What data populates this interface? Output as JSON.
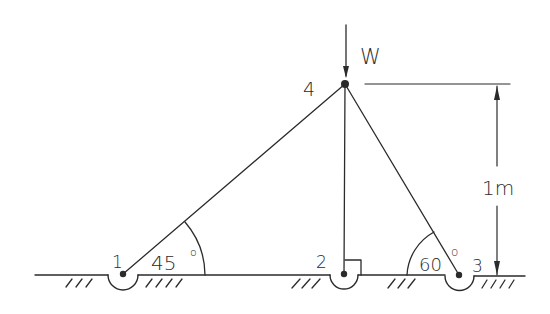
{
  "diagram": {
    "type": "truss-statics",
    "nodes": [
      {
        "id": "1",
        "label": "1",
        "x": 123,
        "y": 275
      },
      {
        "id": "2",
        "label": "2",
        "x": 344,
        "y": 275
      },
      {
        "id": "3",
        "label": "3",
        "x": 459,
        "y": 276
      },
      {
        "id": "4",
        "label": "4",
        "x": 345,
        "y": 84
      }
    ],
    "members": [
      {
        "from": "1",
        "to": "4"
      },
      {
        "from": "2",
        "to": "4"
      },
      {
        "from": "3",
        "to": "4"
      }
    ],
    "load": {
      "label": "W",
      "node": "4",
      "direction": "down"
    },
    "angles": [
      {
        "label": "45°",
        "at_node": "1"
      },
      {
        "label": "60°",
        "at_node": "3"
      }
    ],
    "right_angle_marker": {
      "at_node": "2"
    },
    "dimension": {
      "label": "1m",
      "from_y": "node-4",
      "to_y": "ground"
    },
    "ink_color": "#2b2b2b",
    "background": "#ffffff"
  },
  "labels": {
    "node1": "1",
    "node2": "2",
    "node3": "3",
    "node4": "4",
    "load": "W",
    "angle1": "45",
    "angle3": "60",
    "degree": "o",
    "dimension": "1m"
  }
}
